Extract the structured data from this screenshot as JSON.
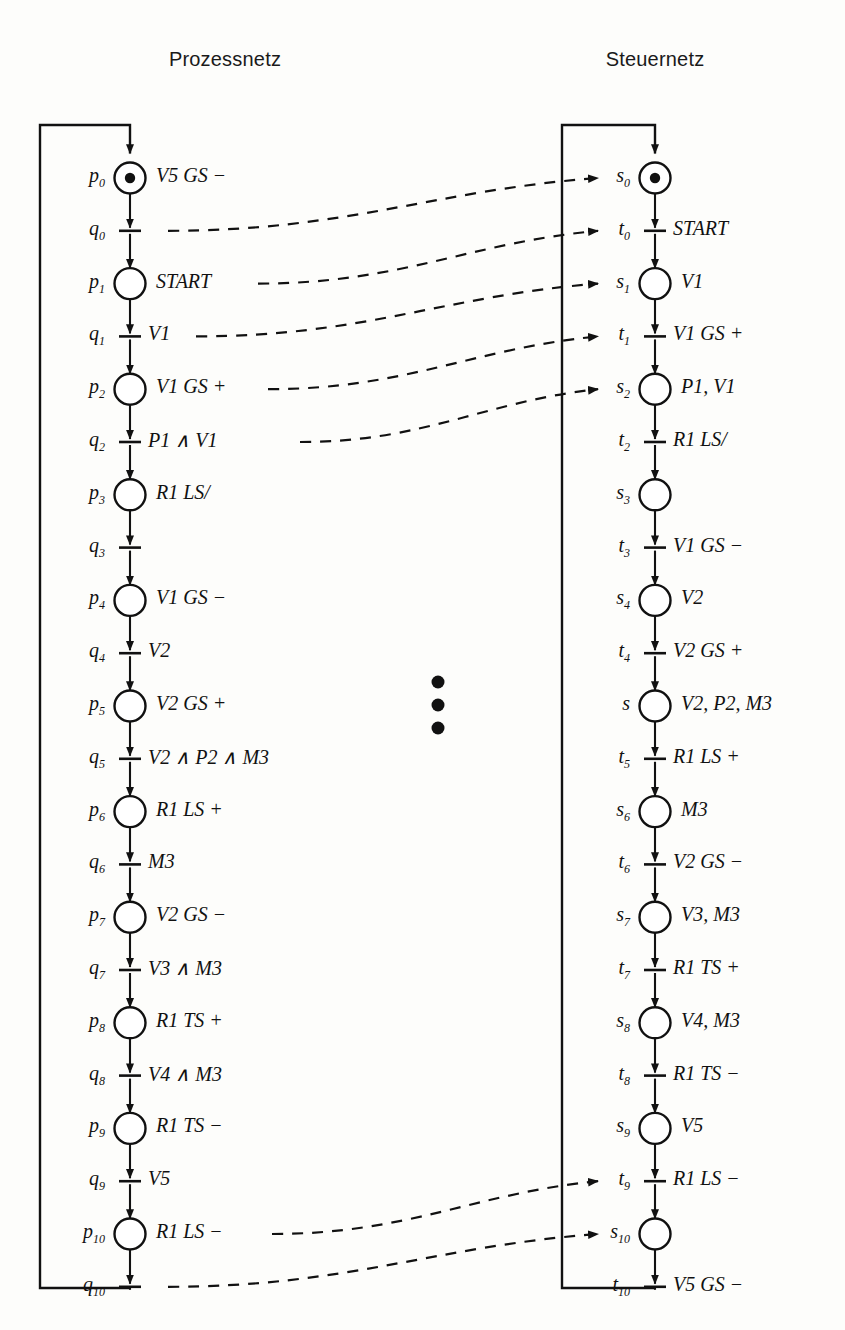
{
  "figure": {
    "type": "petri-net-diagram",
    "left_title": "Prozessnetz",
    "right_title": "Steuernetz",
    "vertical_ellipsis": "⋮"
  },
  "left_net": {
    "title": "Prozessnetz",
    "nodes": [
      {
        "id": "p0",
        "name": "p",
        "sub": "0",
        "kind": "place",
        "marked": true,
        "label": "V5 GS −"
      },
      {
        "id": "q0",
        "name": "q",
        "sub": "0",
        "kind": "transition",
        "marked": false,
        "label": ""
      },
      {
        "id": "p1",
        "name": "p",
        "sub": "1",
        "kind": "place",
        "marked": false,
        "label": "START"
      },
      {
        "id": "q1",
        "name": "q",
        "sub": "1",
        "kind": "transition",
        "marked": false,
        "label": "V1"
      },
      {
        "id": "p2",
        "name": "p",
        "sub": "2",
        "kind": "place",
        "marked": false,
        "label": "V1 GS +"
      },
      {
        "id": "q2",
        "name": "q",
        "sub": "2",
        "kind": "transition",
        "marked": false,
        "label": "P1 ∧ V1"
      },
      {
        "id": "p3",
        "name": "p",
        "sub": "3",
        "kind": "place",
        "marked": false,
        "label": "R1 LS/"
      },
      {
        "id": "q3",
        "name": "q",
        "sub": "3",
        "kind": "transition",
        "marked": false,
        "label": ""
      },
      {
        "id": "p4",
        "name": "p",
        "sub": "4",
        "kind": "place",
        "marked": false,
        "label": "V1 GS −"
      },
      {
        "id": "q4",
        "name": "q",
        "sub": "4",
        "kind": "transition",
        "marked": false,
        "label": "V2"
      },
      {
        "id": "p5",
        "name": "p",
        "sub": "5",
        "kind": "place",
        "marked": false,
        "label": "V2 GS +"
      },
      {
        "id": "q5",
        "name": "q",
        "sub": "5",
        "kind": "transition",
        "marked": false,
        "label": "V2 ∧ P2 ∧ M3"
      },
      {
        "id": "p6",
        "name": "p",
        "sub": "6",
        "kind": "place",
        "marked": false,
        "label": "R1 LS +"
      },
      {
        "id": "q6",
        "name": "q",
        "sub": "6",
        "kind": "transition",
        "marked": false,
        "label": "M3"
      },
      {
        "id": "p7",
        "name": "p",
        "sub": "7",
        "kind": "place",
        "marked": false,
        "label": "V2 GS −"
      },
      {
        "id": "q7",
        "name": "q",
        "sub": "7",
        "kind": "transition",
        "marked": false,
        "label": "V3 ∧ M3"
      },
      {
        "id": "p8",
        "name": "p",
        "sub": "8",
        "kind": "place",
        "marked": false,
        "label": "R1 TS +"
      },
      {
        "id": "q8",
        "name": "q",
        "sub": "8",
        "kind": "transition",
        "marked": false,
        "label": "V4 ∧ M3"
      },
      {
        "id": "p9",
        "name": "p",
        "sub": "9",
        "kind": "place",
        "marked": false,
        "label": "R1 TS −"
      },
      {
        "id": "q9",
        "name": "q",
        "sub": "9",
        "kind": "transition",
        "marked": false,
        "label": "V5"
      },
      {
        "id": "p10",
        "name": "p",
        "sub": "10",
        "kind": "place",
        "marked": false,
        "label": "R1 LS −"
      },
      {
        "id": "q10",
        "name": "q",
        "sub": "10",
        "kind": "transition",
        "marked": false,
        "label": ""
      }
    ]
  },
  "right_net": {
    "title": "Steuernetz",
    "nodes": [
      {
        "id": "s0",
        "name": "s",
        "sub": "0",
        "kind": "place",
        "marked": true,
        "label": ""
      },
      {
        "id": "t0",
        "name": "t",
        "sub": "0",
        "kind": "transition",
        "marked": false,
        "label": "START"
      },
      {
        "id": "s1",
        "name": "s",
        "sub": "1",
        "kind": "place",
        "marked": false,
        "label": "V1"
      },
      {
        "id": "t1",
        "name": "t",
        "sub": "1",
        "kind": "transition",
        "marked": false,
        "label": "V1 GS +"
      },
      {
        "id": "s2",
        "name": "s",
        "sub": "2",
        "kind": "place",
        "marked": false,
        "label": "P1, V1"
      },
      {
        "id": "t2",
        "name": "t",
        "sub": "2",
        "kind": "transition",
        "marked": false,
        "label": "R1 LS/"
      },
      {
        "id": "s3",
        "name": "s",
        "sub": "3",
        "kind": "place",
        "marked": false,
        "label": ""
      },
      {
        "id": "t3",
        "name": "t",
        "sub": "3",
        "kind": "transition",
        "marked": false,
        "label": "V1 GS −"
      },
      {
        "id": "s4",
        "name": "s",
        "sub": "4",
        "kind": "place",
        "marked": false,
        "label": "V2"
      },
      {
        "id": "t4",
        "name": "t",
        "sub": "4",
        "kind": "transition",
        "marked": false,
        "label": "V2 GS +"
      },
      {
        "id": "s5",
        "name": "s",
        "sub": "",
        "kind": "place",
        "marked": false,
        "label": "V2, P2, M3"
      },
      {
        "id": "t5",
        "name": "t",
        "sub": "5",
        "kind": "transition",
        "marked": false,
        "label": "R1 LS +"
      },
      {
        "id": "s6",
        "name": "s",
        "sub": "6",
        "kind": "place",
        "marked": false,
        "label": "M3"
      },
      {
        "id": "t6",
        "name": "t",
        "sub": "6",
        "kind": "transition",
        "marked": false,
        "label": "V2 GS −"
      },
      {
        "id": "s7",
        "name": "s",
        "sub": "7",
        "kind": "place",
        "marked": false,
        "label": "V3, M3"
      },
      {
        "id": "t7",
        "name": "t",
        "sub": "7",
        "kind": "transition",
        "marked": false,
        "label": "R1 TS +"
      },
      {
        "id": "s8",
        "name": "s",
        "sub": "8",
        "kind": "place",
        "marked": false,
        "label": "V4, M3"
      },
      {
        "id": "t8",
        "name": "t",
        "sub": "8",
        "kind": "transition",
        "marked": false,
        "label": "R1 TS −"
      },
      {
        "id": "s9",
        "name": "s",
        "sub": "9",
        "kind": "place",
        "marked": false,
        "label": "V5"
      },
      {
        "id": "t9",
        "name": "t",
        "sub": "9",
        "kind": "transition",
        "marked": false,
        "label": "R1 LS −"
      },
      {
        "id": "s10",
        "name": "s",
        "sub": "10",
        "kind": "place",
        "marked": false,
        "label": ""
      },
      {
        "id": "t10",
        "name": "t",
        "sub": "10",
        "kind": "transition",
        "marked": false,
        "label": "V5 GS −"
      }
    ]
  },
  "interface_arcs": [
    {
      "from": "q0",
      "to": "s0"
    },
    {
      "from": "p1",
      "to": "t0"
    },
    {
      "from": "q1",
      "to": "s1"
    },
    {
      "from": "p2",
      "to": "t1"
    },
    {
      "from": "q2",
      "to": "s2"
    },
    {
      "from": "p10",
      "to": "t9"
    },
    {
      "from": "q10",
      "to": "s10"
    }
  ],
  "style": {
    "stroke": "#111111",
    "background": "#fdfdfb",
    "token_fill": "#111111"
  }
}
